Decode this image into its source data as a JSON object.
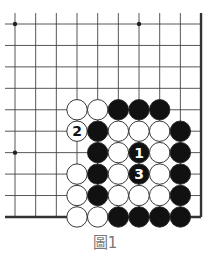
{
  "caption": "圖1",
  "board": {
    "columns": 10,
    "rows": 10,
    "x0": 15,
    "y0": 24,
    "dx": 20.67,
    "dy": 21.44,
    "line_left": 5,
    "line_top": 13,
    "right_edge_thick": true,
    "bottom_edge_thick": true,
    "line_color": "#444444",
    "edge_color": "#333333",
    "star_points": [
      [
        0,
        0
      ],
      [
        6,
        0
      ],
      [
        0,
        6
      ]
    ]
  },
  "stones": [
    {
      "col": 3,
      "row": 4,
      "color": "white"
    },
    {
      "col": 4,
      "row": 4,
      "color": "white"
    },
    {
      "col": 5,
      "row": 4,
      "color": "black"
    },
    {
      "col": 6,
      "row": 4,
      "color": "black"
    },
    {
      "col": 7,
      "row": 4,
      "color": "black"
    },
    {
      "col": 3,
      "row": 5,
      "color": "white",
      "label": "2"
    },
    {
      "col": 4,
      "row": 5,
      "color": "black"
    },
    {
      "col": 5,
      "row": 5,
      "color": "white"
    },
    {
      "col": 6,
      "row": 5,
      "color": "white"
    },
    {
      "col": 7,
      "row": 5,
      "color": "white"
    },
    {
      "col": 8,
      "row": 5,
      "color": "black"
    },
    {
      "col": 4,
      "row": 6,
      "color": "black"
    },
    {
      "col": 5,
      "row": 6,
      "color": "white"
    },
    {
      "col": 6,
      "row": 6,
      "color": "black",
      "label": "1"
    },
    {
      "col": 7,
      "row": 6,
      "color": "white"
    },
    {
      "col": 8,
      "row": 6,
      "color": "black"
    },
    {
      "col": 3,
      "row": 7,
      "color": "white"
    },
    {
      "col": 4,
      "row": 7,
      "color": "black"
    },
    {
      "col": 5,
      "row": 7,
      "color": "white"
    },
    {
      "col": 6,
      "row": 7,
      "color": "black",
      "label": "3"
    },
    {
      "col": 7,
      "row": 7,
      "color": "white"
    },
    {
      "col": 8,
      "row": 7,
      "color": "black"
    },
    {
      "col": 3,
      "row": 8,
      "color": "white"
    },
    {
      "col": 4,
      "row": 8,
      "color": "black"
    },
    {
      "col": 5,
      "row": 8,
      "color": "white"
    },
    {
      "col": 6,
      "row": 8,
      "color": "white"
    },
    {
      "col": 7,
      "row": 8,
      "color": "white"
    },
    {
      "col": 8,
      "row": 8,
      "color": "black"
    },
    {
      "col": 3,
      "row": 9,
      "color": "white"
    },
    {
      "col": 4,
      "row": 9,
      "color": "white"
    },
    {
      "col": 5,
      "row": 9,
      "color": "black"
    },
    {
      "col": 6,
      "row": 9,
      "color": "black"
    },
    {
      "col": 7,
      "row": 9,
      "color": "black"
    },
    {
      "col": 8,
      "row": 9,
      "color": "black"
    }
  ]
}
